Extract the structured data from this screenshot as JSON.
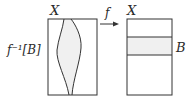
{
  "diagram": {
    "left_set_label": "X",
    "right_set_label": "X",
    "map_label": "f",
    "preimage_label": "f⁻¹[B]",
    "band_label": "B",
    "colors": {
      "stroke": "#333333",
      "fill_region": "#f0f0f0"
    }
  }
}
